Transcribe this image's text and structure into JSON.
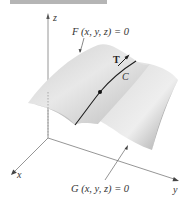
{
  "figure": {
    "axes": {
      "z_label": "z",
      "x_label": "x",
      "y_label": "y"
    },
    "surface_F_label": "F (x, y, z) = 0",
    "surface_G_label": "G (x, y, z) = 0",
    "curve_label": "C",
    "tangent_label": "T",
    "colors": {
      "surface_light": "#e6e6e6",
      "surface_dark": "#9a9a9a",
      "axis": "#888888",
      "curve": "#222222",
      "header_bar": "#b5b5b5"
    }
  }
}
